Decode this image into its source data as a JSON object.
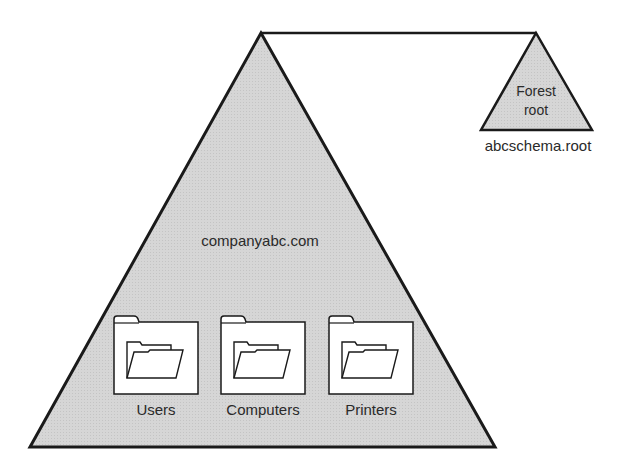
{
  "diagram": {
    "colors": {
      "fill": "#d4d4d4",
      "stroke": "#1a1a1a",
      "folder_fill": "#ffffff",
      "text": "#2a2a2a"
    },
    "domain_tree": {
      "name": "companyabc.com",
      "folders": [
        {
          "label": "Users"
        },
        {
          "label": "Computers"
        },
        {
          "label": "Printers"
        }
      ]
    },
    "forest_root": {
      "line1": "Forest",
      "line2": "root",
      "name": "abcschema.root"
    }
  }
}
